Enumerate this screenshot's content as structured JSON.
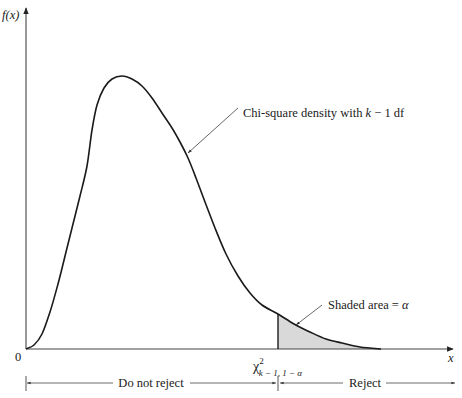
{
  "chart_data": {
    "type": "area",
    "title": "",
    "xlabel": "x",
    "ylabel": "f(x)",
    "origin_label": "0",
    "grid": false,
    "legend": null,
    "series": [
      {
        "name": "Chi-square density with k - 1 df",
        "points_px": [
          [
            26,
            349
          ],
          [
            34,
            345
          ],
          [
            42,
            334
          ],
          [
            50,
            312
          ],
          [
            58,
            284
          ],
          [
            66,
            252
          ],
          [
            72,
            228
          ],
          [
            80,
            196
          ],
          [
            87,
            166
          ],
          [
            92,
            130
          ],
          [
            97,
            105
          ],
          [
            104,
            88
          ],
          [
            112,
            79
          ],
          [
            122,
            76
          ],
          [
            132,
            79
          ],
          [
            142,
            86
          ],
          [
            152,
            98
          ],
          [
            162,
            113
          ],
          [
            172,
            128
          ],
          [
            180,
            142
          ],
          [
            188,
            158
          ],
          [
            196,
            178
          ],
          [
            205,
            202
          ],
          [
            215,
            228
          ],
          [
            226,
            254
          ],
          [
            238,
            276
          ],
          [
            250,
            293
          ],
          [
            262,
            305
          ],
          [
            278,
            314
          ],
          [
            294,
            324
          ],
          [
            310,
            332
          ],
          [
            326,
            339
          ],
          [
            342,
            343
          ],
          [
            360,
            347
          ],
          [
            381,
            349
          ]
        ]
      }
    ],
    "critical_value": {
      "label_base": "χ",
      "label_sup": "2",
      "label_sub": "k − 1, 1 − α",
      "x_px": 278
    },
    "shaded_region": {
      "from_x_px": 278,
      "to_x_px": 381,
      "fill": "#d9d9d9"
    },
    "annotations": [
      {
        "id": "density",
        "text_prefix": "Chi-square density with ",
        "text_var": "k",
        "text_suffix": " − 1 df",
        "arrow_from": [
          238,
          108
        ],
        "arrow_to": [
          187,
          154
        ]
      },
      {
        "id": "shaded",
        "text_prefix": "Shaded area = ",
        "text_var": "α",
        "arrow_from": [
          322,
          306
        ],
        "arrow_to": [
          295,
          326
        ]
      }
    ],
    "regions": [
      {
        "label": "Do not reject",
        "from_x_px": 26,
        "to_x_px": 278
      },
      {
        "label": "Reject",
        "from_x_px": 278,
        "to_x_px": 455
      }
    ]
  },
  "axes": {
    "y_label": "f(x)",
    "x_label": "x",
    "origin": "0"
  },
  "labels": {
    "density_prefix": "Chi-square density with ",
    "density_var": "k",
    "density_suffix": " − 1 df",
    "shaded_prefix": "Shaded area = ",
    "shaded_var": "α",
    "crit_base": "χ",
    "crit_sup": "2",
    "crit_sub": "k − 1, 1 − α",
    "do_not_reject": "Do not reject",
    "reject": "Reject"
  },
  "colors": {
    "curve": "#1a1a1a",
    "axis": "#333333",
    "shade": "#d9d9d9",
    "arrow": "#555555"
  }
}
